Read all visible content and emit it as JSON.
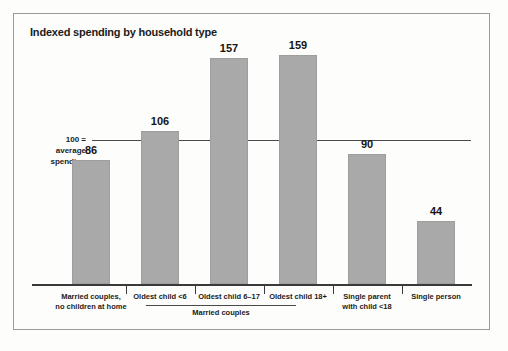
{
  "chart_data": {
    "type": "bar",
    "title": "Indexed spending by household type",
    "xlabel": "",
    "ylabel": "",
    "categories": [
      "Married couples, no children at home",
      "Oldest child <6",
      "Oldest child 6–17",
      "Oldest child 18+",
      "Single parent with child <18",
      "Single person"
    ],
    "category_lines": [
      [
        "Married couples,",
        "no children at home"
      ],
      [
        "Oldest child <6"
      ],
      [
        "Oldest child 6–17"
      ],
      [
        "Oldest child 18+"
      ],
      [
        "Single parent",
        "with child <18"
      ],
      [
        "Single person"
      ]
    ],
    "values": [
      86,
      106,
      157,
      159,
      90,
      44
    ],
    "value_labels": [
      "86",
      "106",
      "157",
      "159",
      "90",
      "44"
    ],
    "reference_line": {
      "value": 100,
      "caption_lines": [
        "100 =",
        "average",
        "spending"
      ]
    },
    "group_bracket": {
      "label": "Married couples",
      "covers": [
        "Oldest child <6",
        "Oldest child 6–17",
        "Oldest child 18+"
      ]
    },
    "ylim": [
      0,
      196
    ],
    "grid": false,
    "legend": false,
    "colors": {
      "bar_fill": "#a9a9a9",
      "bar_stroke": "#9e9e9e",
      "axis": "#3a3a3a",
      "reference_line": "#4a4a4a",
      "text": "#1b1b1b",
      "background": "#fdfdfb",
      "frame": "#9a9a96"
    }
  }
}
